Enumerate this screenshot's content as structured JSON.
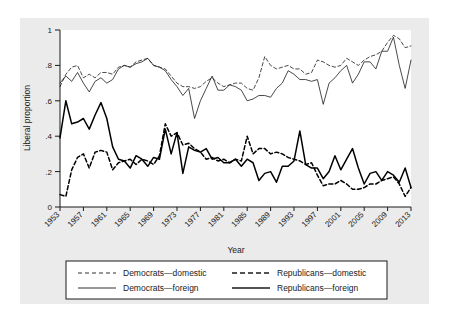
{
  "chart_data": {
    "type": "line",
    "title": "",
    "xlabel": "Year",
    "ylabel": "Liberal proportion",
    "xlim": [
      1953,
      2013
    ],
    "ylim": [
      0,
      1
    ],
    "grid": false,
    "legend_position": "bottom",
    "xticks": [
      1953,
      1957,
      1961,
      1965,
      1969,
      1973,
      1977,
      1981,
      1985,
      1989,
      1993,
      1997,
      2001,
      2005,
      2009,
      2013
    ],
    "yticks": [
      "0",
      ".2",
      ".4",
      ".6",
      ".8",
      "1"
    ],
    "ytick_values": [
      0,
      0.2,
      0.4,
      0.6,
      0.8,
      1
    ],
    "x": [
      1953,
      1954,
      1955,
      1956,
      1957,
      1958,
      1959,
      1960,
      1961,
      1962,
      1963,
      1964,
      1965,
      1966,
      1967,
      1968,
      1969,
      1970,
      1971,
      1972,
      1973,
      1974,
      1975,
      1976,
      1977,
      1978,
      1979,
      1980,
      1981,
      1982,
      1983,
      1984,
      1985,
      1986,
      1987,
      1988,
      1989,
      1990,
      1991,
      1992,
      1993,
      1994,
      1995,
      1996,
      1997,
      1998,
      1999,
      2000,
      2001,
      2002,
      2003,
      2004,
      2005,
      2006,
      2007,
      2008,
      2009,
      2010,
      2011,
      2012,
      2013
    ],
    "series": [
      {
        "name": "Democrats—domestic",
        "style": "dashed",
        "width": "thin",
        "color": "#1a1a1a",
        "values": [
          0.68,
          0.75,
          0.79,
          0.8,
          0.73,
          0.75,
          0.73,
          0.76,
          0.76,
          0.75,
          0.79,
          0.8,
          0.79,
          0.82,
          0.83,
          0.84,
          0.8,
          0.79,
          0.78,
          0.74,
          0.7,
          0.68,
          0.68,
          0.67,
          0.68,
          0.71,
          0.73,
          0.7,
          0.68,
          0.69,
          0.7,
          0.7,
          0.67,
          0.66,
          0.73,
          0.85,
          0.8,
          0.78,
          0.79,
          0.8,
          0.78,
          0.78,
          0.75,
          0.76,
          0.83,
          0.82,
          0.8,
          0.79,
          0.8,
          0.84,
          0.82,
          0.8,
          0.83,
          0.85,
          0.86,
          0.88,
          0.93,
          0.97,
          0.95,
          0.9,
          0.91
        ]
      },
      {
        "name": "Democrats—foreign",
        "style": "solid",
        "width": "thin",
        "color": "#1a1a1a",
        "values": [
          0.7,
          0.74,
          0.71,
          0.76,
          0.7,
          0.65,
          0.71,
          0.73,
          0.7,
          0.72,
          0.78,
          0.8,
          0.79,
          0.81,
          0.82,
          0.84,
          0.8,
          0.79,
          0.77,
          0.72,
          0.68,
          0.63,
          0.67,
          0.5,
          0.6,
          0.67,
          0.74,
          0.66,
          0.66,
          0.69,
          0.68,
          0.66,
          0.6,
          0.61,
          0.63,
          0.63,
          0.62,
          0.67,
          0.7,
          0.77,
          0.75,
          0.72,
          0.72,
          0.71,
          0.72,
          0.58,
          0.7,
          0.73,
          0.77,
          0.8,
          0.7,
          0.75,
          0.82,
          0.82,
          0.78,
          0.88,
          0.88,
          0.96,
          0.8,
          0.67,
          0.83
        ]
      },
      {
        "name": "Republicans—domestic",
        "style": "dashed",
        "width": "thick",
        "color": "#000000",
        "values": [
          0.07,
          0.06,
          0.21,
          0.28,
          0.3,
          0.22,
          0.31,
          0.32,
          0.31,
          0.21,
          0.25,
          0.26,
          0.27,
          0.24,
          0.27,
          0.26,
          0.24,
          0.29,
          0.47,
          0.4,
          0.42,
          0.35,
          0.36,
          0.33,
          0.31,
          0.27,
          0.28,
          0.26,
          0.27,
          0.25,
          0.27,
          0.26,
          0.4,
          0.3,
          0.33,
          0.33,
          0.3,
          0.31,
          0.3,
          0.28,
          0.27,
          0.26,
          0.24,
          0.25,
          0.18,
          0.12,
          0.13,
          0.13,
          0.15,
          0.13,
          0.1,
          0.1,
          0.11,
          0.13,
          0.13,
          0.15,
          0.16,
          0.17,
          0.13,
          0.06,
          0.11
        ]
      },
      {
        "name": "Republicans—foreign",
        "style": "solid",
        "width": "thick",
        "color": "#000000",
        "values": [
          0.39,
          0.6,
          0.47,
          0.48,
          0.5,
          0.44,
          0.52,
          0.59,
          0.5,
          0.34,
          0.27,
          0.26,
          0.22,
          0.29,
          0.27,
          0.23,
          0.28,
          0.27,
          0.44,
          0.3,
          0.42,
          0.19,
          0.34,
          0.32,
          0.31,
          0.33,
          0.27,
          0.28,
          0.25,
          0.25,
          0.27,
          0.23,
          0.27,
          0.25,
          0.15,
          0.19,
          0.2,
          0.14,
          0.23,
          0.23,
          0.26,
          0.43,
          0.24,
          0.22,
          0.22,
          0.16,
          0.2,
          0.29,
          0.21,
          0.27,
          0.33,
          0.22,
          0.13,
          0.19,
          0.2,
          0.15,
          0.2,
          0.18,
          0.14,
          0.22,
          0.11
        ]
      }
    ]
  },
  "legend": {
    "entries": [
      {
        "label": "Democrats—domestic",
        "style": "dashed",
        "width": "thin"
      },
      {
        "label": "Republicans—domestic",
        "style": "dashed",
        "width": "thick"
      },
      {
        "label": "Democrats—foreign",
        "style": "solid",
        "width": "thin"
      },
      {
        "label": "Republicans—foreign",
        "style": "solid",
        "width": "thick"
      }
    ]
  },
  "colors": {
    "background": "#ffffff",
    "outer_panel": "#ebebeb",
    "plot_area": "#ffffff",
    "axis": "#1a1a1a",
    "ink": "#000000"
  }
}
